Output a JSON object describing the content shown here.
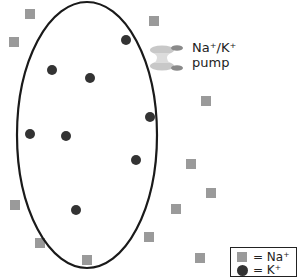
{
  "diagram": {
    "pump_label_line1": "Na⁺/K⁺",
    "pump_label_line2": "pump",
    "colors": {
      "membrane": "#1a1a1a",
      "sodium": "#9a9a9a",
      "potassium": "#333333",
      "pump_light": "#c8c8c8",
      "pump_dark": "#8a8a8a"
    },
    "cell": {
      "cx": 87,
      "cy": 135,
      "rx": 70,
      "ry": 133
    },
    "sodium_ions_outside": [
      [
        30,
        14
      ],
      [
        14,
        42
      ],
      [
        154,
        21
      ],
      [
        206,
        101
      ],
      [
        191,
        164
      ],
      [
        211,
        193
      ],
      [
        176,
        209
      ],
      [
        15,
        205
      ],
      [
        40,
        243
      ],
      [
        87,
        260
      ],
      [
        149,
        237
      ],
      [
        200,
        258
      ]
    ],
    "potassium_ions_inside": [
      [
        126,
        40
      ],
      [
        52,
        70
      ],
      [
        90,
        78
      ],
      [
        150,
        117
      ],
      [
        30,
        134
      ],
      [
        66,
        136
      ],
      [
        136,
        160
      ],
      [
        76,
        210
      ]
    ]
  },
  "legend": {
    "items": [
      {
        "symbol": "square",
        "label": "= Na⁺"
      },
      {
        "symbol": "circle",
        "label": "= K⁺"
      }
    ]
  }
}
